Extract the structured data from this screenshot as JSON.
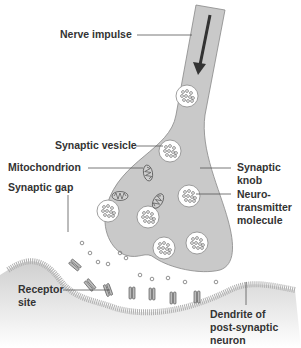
{
  "diagram": {
    "labels": {
      "nerve_impulse": "Nerve impulse",
      "synaptic_vesicle": "Synaptic vesicle",
      "mitochondrion": "Mitochondrion",
      "synaptic_gap": "Synaptic gap",
      "synaptic_knob_1": "Synaptic",
      "synaptic_knob_2": "knob",
      "neuro_1": "Neuro-",
      "neuro_2": "transmitter",
      "neuro_3": "molecule",
      "receptor_1": "Receptor",
      "receptor_2": "site",
      "dendrite_1": "Dendrite of",
      "dendrite_2": "post-synaptic",
      "dendrite_3": "neuron"
    },
    "colors": {
      "axon_fill": "#c9c9c9",
      "membrane": "#b5b5b5",
      "dendrite_fill": "#d8d8d8",
      "line": "#555555",
      "text": "#333333"
    }
  }
}
